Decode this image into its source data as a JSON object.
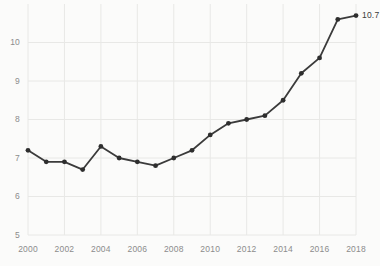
{
  "chart_data": {
    "type": "line",
    "title": "",
    "subtitle": "",
    "xlabel": "",
    "ylabel": "",
    "x": [
      2000,
      2001,
      2002,
      2003,
      2004,
      2005,
      2006,
      2007,
      2008,
      2009,
      2010,
      2011,
      2012,
      2013,
      2014,
      2015,
      2016,
      2017,
      2018
    ],
    "series": [
      {
        "name": "",
        "values": [
          7.2,
          6.9,
          6.9,
          6.7,
          7.3,
          7.0,
          6.9,
          6.8,
          7.0,
          7.2,
          7.6,
          7.9,
          8.0,
          8.1,
          8.5,
          9.2,
          9.6,
          10.6,
          10.7
        ]
      }
    ],
    "xlim": [
      2000,
      2018
    ],
    "ylim": [
      5,
      11
    ],
    "y_ticks": [
      5,
      6,
      7,
      8,
      9,
      10
    ],
    "y_tick_labels": [
      "5",
      "6",
      "7",
      "8",
      "9",
      "10"
    ],
    "x_ticks": [
      2000,
      2002,
      2004,
      2006,
      2008,
      2010,
      2012,
      2014,
      2016,
      2018
    ],
    "x_tick_labels": [
      "2000",
      "2002",
      "2004",
      "2006",
      "2008",
      "2010",
      "2012",
      "2014",
      "2016",
      "2018"
    ],
    "grid": true,
    "legend": "none",
    "annotations": [
      {
        "text": "10.7",
        "x": 2018,
        "y": 10.7
      }
    ],
    "colors": {
      "line": "#3b3b3b",
      "marker": "#2e2e2e",
      "grid": "#e8e8e6",
      "background": "#fbfbfa",
      "tick_text": "#8c8c8c",
      "annotation_text": "#3b3b3b"
    },
    "style": {
      "line_width": 1.8,
      "marker_radius": 2.4,
      "marker_shape": "circle"
    }
  }
}
